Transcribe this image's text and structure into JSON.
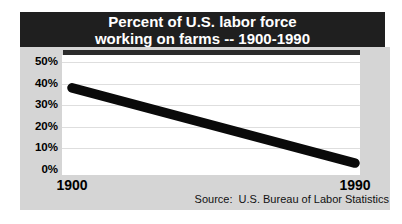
{
  "banner": {
    "line1": "Percent of U.S. labor force",
    "line2": "working on farms -- 1900-1990"
  },
  "colors": {
    "banner_bg": "#1f1f1f",
    "banner_text": "#ffffff",
    "card_bg": "#d5d5d5",
    "plot_bg": "#ffffff",
    "gridline": "#dedede",
    "line": "#0a0a0a",
    "label_text": "#000000"
  },
  "chart_data": {
    "type": "line",
    "title": "Percent of U.S. labor force working on farms -- 1900-1990",
    "xlabel": "",
    "ylabel": "",
    "x_ticks": [
      "1900",
      "1990"
    ],
    "y_ticks": [
      "50%",
      "40%",
      "30%",
      "20%",
      "10%",
      "0%"
    ],
    "xlim": [
      1900,
      1990
    ],
    "ylim": [
      0,
      50
    ],
    "grid": "horizontal",
    "legend": "none",
    "series": [
      {
        "name": "Percent of U.S. labor force working on farms",
        "points": [
          {
            "x": 1900,
            "y": 38
          },
          {
            "x": 1990,
            "y": 3
          }
        ]
      }
    ],
    "source": "Source:  U.S. Bureau of Labor Statistics"
  }
}
